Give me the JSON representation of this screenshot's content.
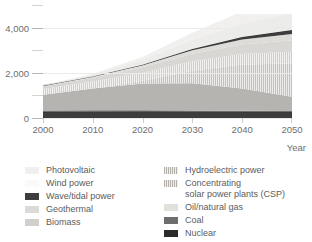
{
  "chart_data": {
    "type": "area",
    "title": "",
    "xlabel": "Year",
    "ylabel": "",
    "xlim": [
      2000,
      2050
    ],
    "ylim": [
      0,
      4600
    ],
    "grid": true,
    "legend_position": "bottom",
    "x": [
      2000,
      2010,
      2020,
      2030,
      2040,
      2050
    ],
    "x_ticks": [
      "2000",
      "2010",
      "2020",
      "2030",
      "2040",
      "2050"
    ],
    "y_ticks": [
      "0",
      "2,000",
      "4,000"
    ],
    "y_tick_values": [
      0,
      2000,
      4000
    ],
    "y_minor_tick_values": [
      1000,
      3000,
      5000
    ],
    "series": [
      {
        "name": "Nuclear",
        "color": "#3d3d3d",
        "pattern": "solid",
        "values": [
          270,
          280,
          285,
          280,
          275,
          270
        ]
      },
      {
        "name": "Coal",
        "color": "#6e6e6e",
        "pattern": "solid",
        "values": [
          60,
          60,
          58,
          55,
          50,
          45
        ]
      },
      {
        "name": "Oil/natural gas",
        "color": "#b6b4b1",
        "pattern": "solid",
        "values": [
          700,
          960,
          1180,
          1200,
          980,
          620
        ]
      },
      {
        "name": "Concentrating solar power plants (CSP)",
        "color": "#cfcdca",
        "pattern": "hatch",
        "values": [
          0,
          10,
          120,
          560,
          1060,
          1480
        ]
      },
      {
        "name": "Hydroelectric power",
        "color": "#c9c7c4",
        "pattern": "hatch",
        "values": [
          250,
          300,
          360,
          420,
          470,
          520
        ]
      },
      {
        "name": "Biomass",
        "color": "#d9d7d4",
        "pattern": "solid",
        "values": [
          120,
          170,
          240,
          330,
          420,
          500
        ]
      },
      {
        "name": "Geothermal",
        "color": "#dedcd9",
        "pattern": "solid",
        "values": [
          30,
          55,
          95,
          150,
          215,
          280
        ]
      },
      {
        "name": "Wave/tidal power",
        "color": "#3d3d3d",
        "pattern": "solid",
        "values": [
          0,
          5,
          20,
          55,
          110,
          175
        ]
      },
      {
        "name": "Wind power",
        "color": "#ececea",
        "pattern": "solid",
        "values": [
          15,
          90,
          230,
          420,
          600,
          760
        ]
      },
      {
        "name": "Photovoltaic",
        "color": "#f2f0ee",
        "pattern": "solid",
        "values": [
          5,
          30,
          110,
          300,
          530,
          760
        ]
      }
    ],
    "totals": [
      1450,
      1960,
      2698,
      3770,
      4710,
      5410
    ],
    "annotations": []
  },
  "axes": {
    "y_labels": [
      {
        "text": "4,000",
        "value": 4000
      },
      {
        "text": "2,000",
        "value": 2000
      },
      {
        "text": "0",
        "value": 0
      }
    ],
    "x_labels": [
      {
        "text": "2000",
        "value": 2000
      },
      {
        "text": "2010",
        "value": 2010
      },
      {
        "text": "2020",
        "value": 2020
      },
      {
        "text": "2030",
        "value": 2030
      },
      {
        "text": "2040",
        "value": 2040
      },
      {
        "text": "2050",
        "value": 2050
      }
    ],
    "x_axis_title": "Year"
  },
  "legend": {
    "left_column": [
      {
        "label": "Photovoltaic",
        "color": "#f2f0ee",
        "pattern": "solid"
      },
      {
        "label": "Wind power",
        "color": "#fbfafa",
        "pattern": "solid"
      },
      {
        "label": "Wave/tidal power",
        "color": "#3d3d3d",
        "pattern": "solid"
      },
      {
        "label": "Geothermal",
        "color": "#dcdad7",
        "pattern": "solid"
      },
      {
        "label": "Biomass",
        "color": "#d2d0cd",
        "pattern": "solid"
      }
    ],
    "right_column": [
      {
        "label": "Hydroelectric power",
        "color": "#c9c7c4",
        "pattern": "hatch"
      },
      {
        "label": "Concentrating\nsolar power plants (CSP)",
        "color": "#cfcdca",
        "pattern": "hatch"
      },
      {
        "label": "Oil/natural gas",
        "color": "#e2e0dd",
        "pattern": "solid"
      },
      {
        "label": "Coal",
        "color": "#6e6e6e",
        "pattern": "solid"
      },
      {
        "label": "Nuclear",
        "color": "#2b2b2b",
        "pattern": "solid"
      }
    ]
  },
  "colors": {
    "background": "#ffffff",
    "text": "#6e6e6e",
    "gridline": "#eceae8",
    "tick": "#c4c0bc"
  }
}
